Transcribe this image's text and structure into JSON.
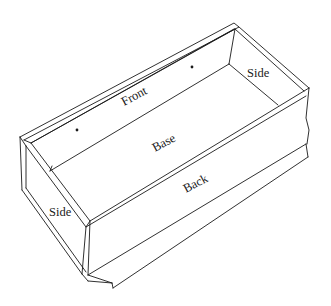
{
  "diagram": {
    "type": "isometric line drawing",
    "labels": {
      "front": "Front",
      "base": "Base",
      "back": "Back",
      "side_right": "Side",
      "side_left": "Side"
    },
    "markers": [
      {
        "name": "nail-hole-left",
        "x": 77,
        "y": 130
      },
      {
        "name": "nail-hole-right",
        "x": 192,
        "y": 67
      }
    ],
    "colors": {
      "line": "#1a1a1a",
      "background": "#ffffff"
    }
  }
}
